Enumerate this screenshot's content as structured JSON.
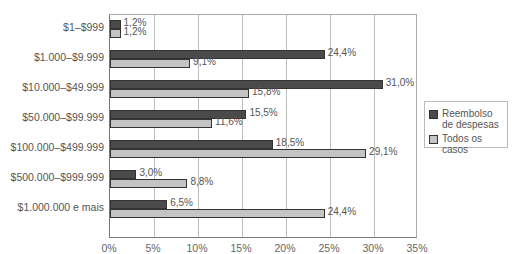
{
  "chart_data": {
    "type": "bar",
    "orientation": "horizontal",
    "title": "",
    "xlabel": "",
    "ylabel": "",
    "xlim": [
      0,
      35
    ],
    "x_ticks": [
      "0%",
      "5%",
      "10%",
      "15%",
      "20%",
      "25%",
      "30%",
      "35%"
    ],
    "x_tick_values": [
      0,
      5,
      10,
      15,
      20,
      25,
      30,
      35
    ],
    "grid": true,
    "legend_position": "right",
    "categories": [
      "$1–$999",
      "$1.000–$9.999",
      "$10.000–$49.999",
      "$50.000–$99.999",
      "$100.000–$499.999",
      "$500.000–$999.999",
      "$1.000.000 e mais"
    ],
    "series": [
      {
        "name": "Reembolso de despesas",
        "color": "#4a4a4a",
        "values": [
          1.2,
          24.4,
          31.0,
          15.5,
          18.5,
          3.0,
          6.5
        ],
        "labels": [
          "1,2%",
          "24,4%",
          "31,0%",
          "15,5%",
          "18,5%",
          "3,0%",
          "6,5%"
        ]
      },
      {
        "name": "Todos os casos",
        "color": "#c4c4c4",
        "values": [
          1.2,
          9.1,
          15.8,
          11.6,
          29.1,
          8.8,
          24.4
        ],
        "labels": [
          "1,2%",
          "9,1%",
          "15,8%",
          "11,6%",
          "29,1%",
          "8,8%",
          "24,4%"
        ]
      }
    ]
  },
  "legend": {
    "items": [
      {
        "line1": "Reembolso",
        "line2": "de despesas"
      },
      {
        "line1": "Todos os casos",
        "line2": ""
      }
    ]
  }
}
